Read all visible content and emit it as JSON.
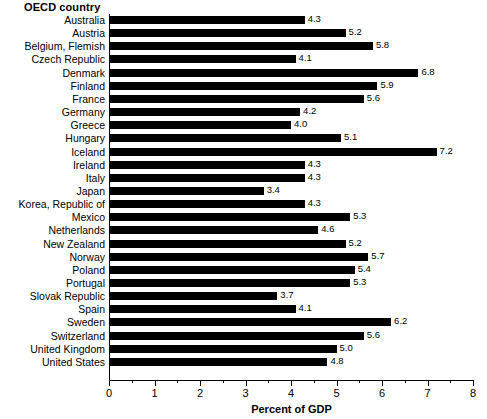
{
  "chart_data": {
    "type": "bar",
    "orientation": "horizontal",
    "title": "",
    "xlabel": "Percent of GDP",
    "ylabel": "OECD country",
    "xlim": [
      0,
      8
    ],
    "xticks": [
      0,
      1,
      2,
      3,
      4,
      5,
      6,
      7,
      8
    ],
    "xtick_labels": [
      "0",
      "1",
      "2",
      "3",
      "4",
      "5",
      "6",
      "7",
      "8"
    ],
    "minor_tick_step": 0.5,
    "grid": false,
    "legend": null,
    "bar_color": "#000000",
    "categories": [
      "Australia",
      "Austria",
      "Belgium, Flemish",
      "Czech Republic",
      "Denmark",
      "Finland",
      "France",
      "Germany",
      "Greece",
      "Hungary",
      "Iceland",
      "Ireland",
      "Italy",
      "Japan",
      "Korea, Republic of",
      "Mexico",
      "Netherlands",
      "New Zealand",
      "Norway",
      "Poland",
      "Portugal",
      "Slovak Republic",
      "Spain",
      "Sweden",
      "Switzerland",
      "United Kingdom",
      "United States"
    ],
    "values": [
      4.3,
      5.2,
      5.8,
      4.1,
      6.8,
      5.9,
      5.6,
      4.2,
      4.0,
      5.1,
      7.2,
      4.3,
      4.3,
      3.4,
      4.3,
      5.3,
      4.6,
      5.2,
      5.7,
      5.4,
      5.3,
      3.7,
      4.1,
      6.2,
      5.6,
      5.0,
      4.8
    ],
    "value_labels": [
      "4.3",
      "5.2",
      "5.8",
      "4.1",
      "6.8",
      "5.9",
      "5.6",
      "4.2",
      "4.0",
      "5.1",
      "7.2",
      "4.3",
      "4.3",
      "3.4",
      "4.3",
      "5.3",
      "4.6",
      "5.2",
      "5.7",
      "5.4",
      "5.3",
      "3.7",
      "4.1",
      "6.2",
      "5.6",
      "5.0",
      "4.8"
    ]
  }
}
